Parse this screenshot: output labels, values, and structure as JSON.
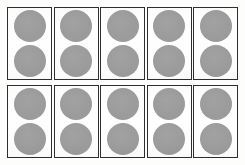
{
  "figure": {
    "kind": "card-grid",
    "rows": 2,
    "columns": 5,
    "total_cards": 10,
    "circles_per_card": 2,
    "total_circles": 20,
    "colors": {
      "page_background": "#fdfdfc",
      "card_background": "#fefefe",
      "card_border": "#2e2e30",
      "circle_fill": "#9b9b9b"
    },
    "cards": [
      {
        "id": "card-1",
        "row": 1,
        "column": 1,
        "circles": [
          {
            "id": "circle-1-top",
            "position": "top"
          },
          {
            "id": "circle-1-bottom",
            "position": "bottom"
          }
        ]
      },
      {
        "id": "card-2",
        "row": 1,
        "column": 2,
        "circles": [
          {
            "id": "circle-2-top",
            "position": "top"
          },
          {
            "id": "circle-2-bottom",
            "position": "bottom"
          }
        ]
      },
      {
        "id": "card-3",
        "row": 1,
        "column": 3,
        "circles": [
          {
            "id": "circle-3-top",
            "position": "top"
          },
          {
            "id": "circle-3-bottom",
            "position": "bottom"
          }
        ]
      },
      {
        "id": "card-4",
        "row": 1,
        "column": 4,
        "circles": [
          {
            "id": "circle-4-top",
            "position": "top"
          },
          {
            "id": "circle-4-bottom",
            "position": "bottom"
          }
        ]
      },
      {
        "id": "card-5",
        "row": 1,
        "column": 5,
        "circles": [
          {
            "id": "circle-5-top",
            "position": "top"
          },
          {
            "id": "circle-5-bottom",
            "position": "bottom"
          }
        ]
      },
      {
        "id": "card-6",
        "row": 2,
        "column": 1,
        "circles": [
          {
            "id": "circle-6-top",
            "position": "top"
          },
          {
            "id": "circle-6-bottom",
            "position": "bottom"
          }
        ]
      },
      {
        "id": "card-7",
        "row": 2,
        "column": 2,
        "circles": [
          {
            "id": "circle-7-top",
            "position": "top"
          },
          {
            "id": "circle-7-bottom",
            "position": "bottom"
          }
        ]
      },
      {
        "id": "card-8",
        "row": 2,
        "column": 3,
        "circles": [
          {
            "id": "circle-8-top",
            "position": "top"
          },
          {
            "id": "circle-8-bottom",
            "position": "bottom"
          }
        ]
      },
      {
        "id": "card-9",
        "row": 2,
        "column": 4,
        "circles": [
          {
            "id": "circle-9-top",
            "position": "top"
          },
          {
            "id": "circle-9-bottom",
            "position": "bottom"
          }
        ]
      },
      {
        "id": "card-10",
        "row": 2,
        "column": 5,
        "circles": [
          {
            "id": "circle-10-top",
            "position": "top"
          },
          {
            "id": "circle-10-bottom",
            "position": "bottom"
          }
        ]
      }
    ]
  }
}
